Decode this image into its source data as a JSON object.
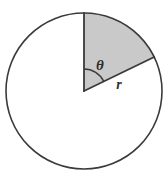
{
  "figure": {
    "background_color": "#ffffff",
    "stroke_color": "#3a3a3a",
    "sector_fill_color": "#c9c9c9",
    "circle": {
      "center_x": 84,
      "center_y": 91,
      "radius": 78,
      "stroke_width": 1.6
    },
    "sector": {
      "start_angle_deg": -90,
      "end_angle_deg": -25.8,
      "sweep_deg": 64.2,
      "radius": 78
    },
    "angle_arc": {
      "radius": 22,
      "stroke_width": 1.4
    },
    "labels": {
      "theta": {
        "text": "θ",
        "x": 100,
        "y": 70,
        "font_size": 15
      },
      "radius": {
        "text": "r",
        "x": 117,
        "y": 89,
        "font_size": 14
      }
    }
  }
}
